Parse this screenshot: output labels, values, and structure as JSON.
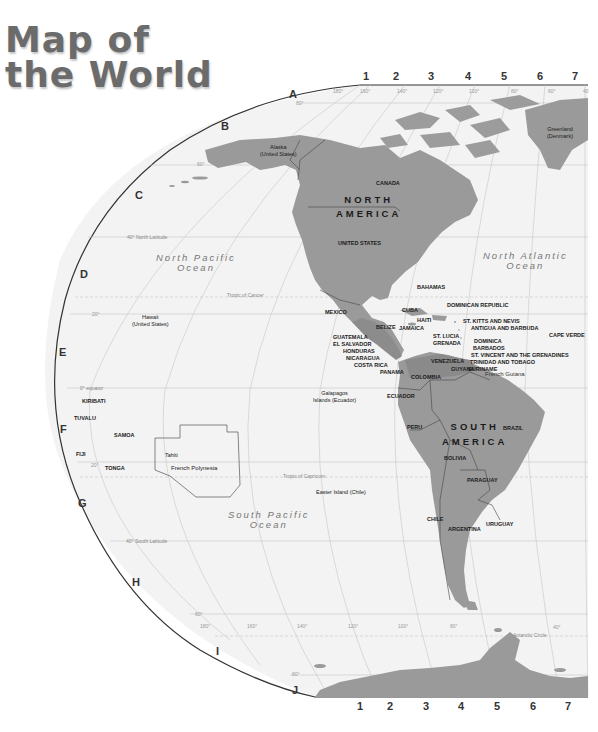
{
  "title": {
    "line1": "Map of",
    "line2": "the World"
  },
  "colors": {
    "land": "#9a9a9a",
    "land_dark": "#8a8a8a",
    "ocean": "#f2f2f2",
    "border": "#444444",
    "grid": "#c4c4c4"
  },
  "grid": {
    "rows": [
      "A",
      "B",
      "C",
      "D",
      "E",
      "F",
      "G",
      "H",
      "I",
      "J"
    ],
    "columns": [
      "1",
      "2",
      "3",
      "4",
      "5",
      "6",
      "7"
    ]
  },
  "longitudes_top": [
    "180°",
    "160°",
    "140°",
    "120°",
    "100°",
    "80°",
    "60°",
    "40"
  ],
  "longitudes_bottom": [
    "180°",
    "160°",
    "140°",
    "120°",
    "100°",
    "80°",
    "40°"
  ],
  "latitudes": {
    "n80": "80°",
    "n60": "60°",
    "n40": "40° North Latitude",
    "n20": "20°",
    "equator": "0° equator",
    "s20": "20°",
    "s40": "40° South Latitude",
    "s60": "60°",
    "s80": "80°",
    "tropic_cancer": "Tropic of Cancer",
    "tropic_capricorn": "Tropic of Capricorn",
    "antarctic_circle": "Antarctic Circle"
  },
  "oceans": {
    "north_pacific": {
      "line1": "North Pacific",
      "line2": "Ocean"
    },
    "north_atlantic": {
      "line1": "North Atlantic",
      "line2": "Ocean"
    },
    "south_pacific": {
      "line1": "South Pacific",
      "line2": "Ocean"
    }
  },
  "continents": {
    "north_america": {
      "line1": "NORTH",
      "line2": "AMERICA"
    },
    "south_america": {
      "line1": "SOUTH",
      "line2": "AMERICA"
    }
  },
  "places": {
    "alaska": {
      "line1": "Alaska",
      "line2": "(United States)"
    },
    "greenland": {
      "line1": "Greenland",
      "line2": "(Denmark)"
    },
    "hawaii": {
      "line1": "Hawaii",
      "line2": "(United States)"
    },
    "galapagos": {
      "line1": "Galapagos",
      "line2": "Islands (Ecuador)"
    },
    "easter_island": "Easter Island (Chile)",
    "french_polynesia": "French Polynesia",
    "tahiti": "Tahiti",
    "french_guiana": "French Guiana"
  },
  "countries": {
    "canada": "CANADA",
    "united_states": "UNITED STATES",
    "mexico": "MEXICO",
    "bahamas": "BAHAMAS",
    "cuba": "CUBA",
    "haiti": "HAITI",
    "dominican_republic": "DOMINICAN REPUBLIC",
    "jamaica": "JAMAICA",
    "belize": "BELIZE",
    "guatemala": "GUATEMALA",
    "el_salvador": "EL SALVADOR",
    "honduras": "HONDURAS",
    "nicaragua": "NICARAGUA",
    "costa_rica": "COSTA RICA",
    "panama": "PANAMA",
    "st_kitts": "ST. KITTS AND NEVIS",
    "antigua": "ANTIGUA AND BARBUDA",
    "st_lucia": "ST. LUCIA",
    "grenada": "GRENADA",
    "dominica": "DOMINICA",
    "barbados": "BARBADOS",
    "st_vincent": "ST. VINCENT AND THE GRENADINES",
    "trinidad": "TRINIDAD AND TOBAGO",
    "cape_verde": "CAPE VERDE",
    "venezuela": "VENEZUELA",
    "guyana": "GUYANA",
    "suriname": "SURINAME",
    "colombia": "COLOMBIA",
    "ecuador": "ECUADOR",
    "peru": "PERU",
    "brazil": "BRAZIL",
    "bolivia": "BOLIVIA",
    "paraguay": "PARAGUAY",
    "chile": "CHILE",
    "argentina": "ARGENTINA",
    "uruguay": "URUGUAY",
    "kiribati": "KIRIBATI",
    "tuvalu": "TUVALU",
    "samoa": "SAMOA",
    "fiji": "FIJI",
    "tonga": "TONGA"
  }
}
